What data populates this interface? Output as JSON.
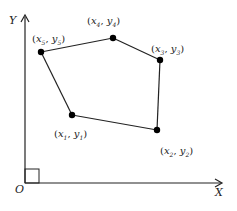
{
  "diagram": {
    "axes": {
      "x_label": "X",
      "y_label": "Y",
      "origin_label": "O"
    },
    "vertices": [
      {
        "id": "P1",
        "x_var": "x",
        "x_sub": "1",
        "y_var": "y",
        "y_sub": "1"
      },
      {
        "id": "P2",
        "x_var": "x",
        "x_sub": "2",
        "y_var": "y",
        "y_sub": "2"
      },
      {
        "id": "P3",
        "x_var": "x",
        "x_sub": "3",
        "y_var": "y",
        "y_sub": "3"
      },
      {
        "id": "P4",
        "x_var": "x",
        "x_sub": "4",
        "y_var": "y",
        "y_sub": "4"
      },
      {
        "id": "P5",
        "x_var": "x",
        "x_sub": "5",
        "y_var": "y",
        "y_sub": "5"
      }
    ],
    "edges": [
      [
        "P1",
        "P2"
      ],
      [
        "P2",
        "P3"
      ],
      [
        "P3",
        "P4"
      ],
      [
        "P4",
        "P5"
      ],
      [
        "P5",
        "P1"
      ]
    ],
    "right_angle_marker_at_origin": true,
    "colors": {
      "stroke": "#222222",
      "point": "#000000"
    }
  }
}
